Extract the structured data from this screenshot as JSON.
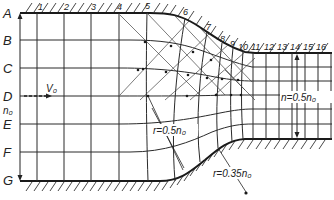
{
  "diagram": {
    "row_labels": [
      "A",
      "B",
      "C",
      "D",
      "E",
      "F",
      "G"
    ],
    "column_labels": [
      "1",
      "2",
      "3",
      "4",
      "5",
      "6",
      "7",
      "8",
      "9",
      "10",
      "11",
      "12",
      "13",
      "14",
      "15",
      "16"
    ],
    "annotations": {
      "velocity": "V₀",
      "inlet_width": "n₀",
      "outlet_width": "n=0.5n₀",
      "upper_radius": "r=0.5n₀",
      "lower_radius": "r=0.35n₀"
    },
    "colors": {
      "line": "#2a2a2a",
      "wall": "#1a1a1a",
      "background": "#ffffff"
    }
  }
}
